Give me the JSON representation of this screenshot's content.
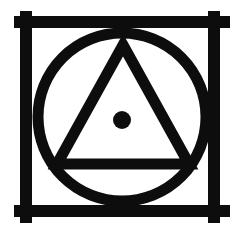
{
  "image": {
    "title": "Esoteric Symbol: Triangle and Dot in Circle within Barred Square",
    "width": 245,
    "height": 240,
    "background_color": "#ffffff",
    "ink_color": "#0d0d0d",
    "style": "monochrome line art, hand-inked woodcut appearance"
  },
  "elements": {
    "frame": {
      "name": "barred-square-frame",
      "description": "Square frame made of four thick bars whose ends overshoot the corners forming plus/cross intersections",
      "stroke_color": "#0d0d0d",
      "stroke_width": 12,
      "top_bar": {
        "x1": 14,
        "y1": 22,
        "x2": 230,
        "y2": 22
      },
      "bottom_bar": {
        "x1": 14,
        "y1": 211,
        "x2": 230,
        "y2": 211
      },
      "left_bar": {
        "x1": 26,
        "y1": 11,
        "x2": 26,
        "y2": 223
      },
      "right_bar": {
        "x1": 214,
        "y1": 11,
        "x2": 214,
        "y2": 223
      },
      "corner_overshoot": 12
    },
    "circle": {
      "name": "inscribed-circle",
      "center_x": 122,
      "center_y": 117,
      "radius": 84,
      "stroke_color": "#0d0d0d",
      "stroke_width": 11
    },
    "triangle": {
      "name": "inscribed-triangle",
      "orientation": "upward",
      "apex": {
        "x": 123,
        "y": 45
      },
      "bottom_left": {
        "x": 57,
        "y": 164
      },
      "bottom_right": {
        "x": 189,
        "y": 164
      },
      "stroke_color": "#0d0d0d",
      "stroke_width": 11
    },
    "dot": {
      "name": "center-dot",
      "center_x": 122,
      "center_y": 120,
      "radius": 9,
      "fill_color": "#0d0d0d"
    }
  }
}
